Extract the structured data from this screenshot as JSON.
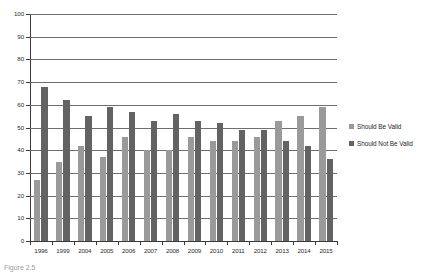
{
  "caption": "Figure 2.5",
  "legend": {
    "position": "right",
    "items": [
      {
        "label": "Should Be Valid",
        "color": "#9a9a9a",
        "swatch": "legend-swatch-valid"
      },
      {
        "label": "Should Not Be Valid",
        "color": "#636363",
        "swatch": "legend-swatch-not-valid"
      }
    ]
  },
  "chart_data": {
    "type": "bar",
    "title": "",
    "subtitle": "",
    "xlabel": "",
    "ylabel": "",
    "ylim": [
      0,
      100
    ],
    "ytick_step": 10,
    "yticks": [
      100,
      90,
      80,
      70,
      60,
      50,
      40,
      30,
      20,
      10,
      0
    ],
    "grid": true,
    "grid_axis": "y",
    "legend_position": "right",
    "categories": [
      "1996",
      "1999",
      "2004",
      "2005",
      "2006",
      "2007",
      "2008",
      "2009",
      "2010",
      "2011",
      "2012",
      "2013",
      "2014",
      "2015"
    ],
    "series": [
      {
        "name": "Should Be Valid",
        "color": "#9a9a9a",
        "values": [
          27,
          35,
          42,
          37,
          46,
          40,
          40,
          46,
          44,
          44,
          46,
          53,
          55,
          59
        ]
      },
      {
        "name": "Should Not Be Valid",
        "color": "#636363",
        "values": [
          68,
          62,
          55,
          59,
          57,
          53,
          56,
          53,
          52,
          49,
          49,
          44,
          42,
          36
        ]
      }
    ]
  }
}
